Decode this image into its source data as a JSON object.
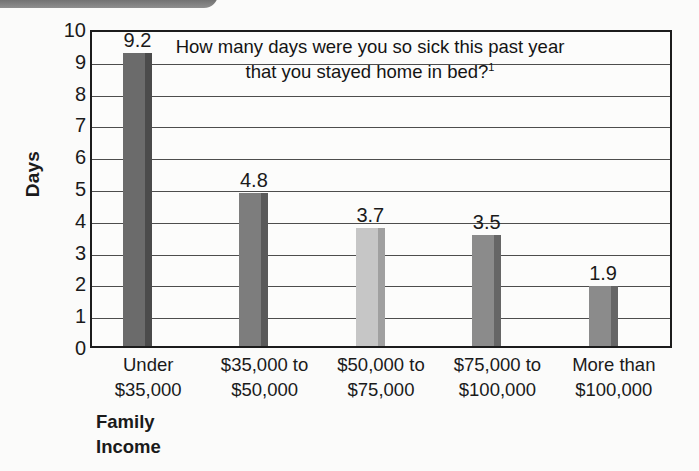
{
  "chart_data": {
    "type": "bar",
    "title": "How many days were you so sick this past year that you stayed home in bed?",
    "title_superscript": "1",
    "xlabel": "Family Income",
    "ylabel": "Days",
    "ylim": [
      0,
      10
    ],
    "ytick_step": 1,
    "grid": true,
    "legend": "none",
    "categories": [
      "Under $35,000",
      "$35,000 to $50,000",
      "$50,000 to $75,000",
      "$75,000 to $100,000",
      "More than $100,000"
    ],
    "category_lines": [
      [
        "Under",
        "$35,000"
      ],
      [
        "$35,000 to",
        "$50,000"
      ],
      [
        "$50,000 to",
        "$75,000"
      ],
      [
        "$75,000 to",
        "$100,000"
      ],
      [
        "More than",
        "$100,000"
      ]
    ],
    "values": [
      9.2,
      4.8,
      3.7,
      3.5,
      1.9
    ],
    "value_labels": [
      "9.2",
      "4.8",
      "3.7",
      "3.5",
      "1.9"
    ],
    "ytick_labels": [
      "10",
      "9",
      "8",
      "7",
      "6",
      "5",
      "4",
      "3",
      "2",
      "1",
      "0"
    ],
    "bar_colors": [
      "#6b6b6b",
      "#7d7d7d",
      "#c6c6c6",
      "#8b8b8b",
      "#8b8b8b"
    ],
    "bar_side_colors": [
      "#4b4b4b",
      "#5a5a5a",
      "#a0a0a0",
      "#666666",
      "#666666"
    ]
  },
  "page": {
    "background_color": "#fbfbfa",
    "axis_color": "#1c1c1c",
    "gridline_color": "#4d4d4d",
    "text_color": "#1a1a1a",
    "banner_color": "#6f6f6f"
  }
}
